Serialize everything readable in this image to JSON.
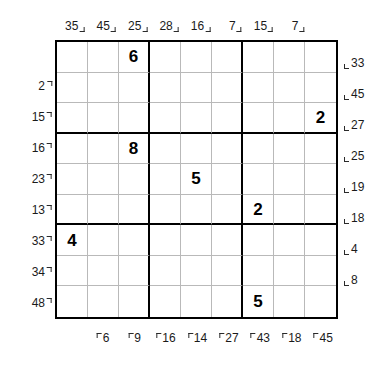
{
  "puzzle": {
    "type": "frame-sudoku",
    "grid_size": 9,
    "box_size": 3,
    "clues_top": [
      35,
      45,
      25,
      28,
      16,
      7,
      15,
      7
    ],
    "clues_left": [
      2,
      15,
      16,
      23,
      13,
      33,
      34,
      48
    ],
    "clues_right": [
      33,
      45,
      27,
      25,
      19,
      18,
      4,
      8
    ],
    "clues_bottom": [
      6,
      9,
      16,
      14,
      27,
      43,
      18,
      45
    ],
    "givens": [
      [
        "",
        "",
        "6",
        "",
        "",
        "",
        "",
        "",
        ""
      ],
      [
        "",
        "",
        "",
        "",
        "",
        "",
        "",
        "",
        ""
      ],
      [
        "",
        "",
        "",
        "",
        "",
        "",
        "",
        "",
        "2"
      ],
      [
        "",
        "",
        "8",
        "",
        "",
        "",
        "",
        "",
        ""
      ],
      [
        "",
        "",
        "",
        "",
        "5",
        "",
        "",
        "",
        ""
      ],
      [
        "",
        "",
        "",
        "",
        "",
        "",
        "2",
        "",
        ""
      ],
      [
        "4",
        "",
        "",
        "",
        "",
        "",
        "",
        "",
        ""
      ],
      [
        "",
        "",
        "",
        "",
        "",
        "",
        "",
        "",
        ""
      ],
      [
        "",
        "",
        "",
        "",
        "",
        "",
        "5",
        "",
        ""
      ]
    ]
  }
}
